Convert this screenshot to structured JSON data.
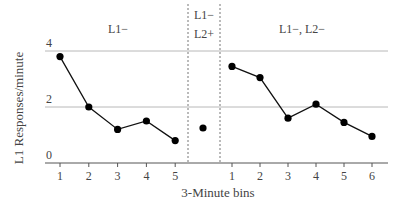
{
  "chart_data": {
    "type": "line",
    "title": "",
    "xlabel": "3-Minute bins",
    "ylabel": "L1 Responses/minute",
    "ylim": [
      0,
      4
    ],
    "yticks": [
      0,
      2,
      4
    ],
    "grid": true,
    "phases": [
      {
        "label": "L1−",
        "label_lines": [
          "L1−"
        ],
        "x": [
          1,
          2,
          3,
          4,
          5
        ],
        "values": [
          3.8,
          2.0,
          1.2,
          1.5,
          0.8
        ]
      },
      {
        "label": "L1− L2+",
        "label_lines": [
          "L1−",
          "L2+"
        ],
        "x": [
          1
        ],
        "values": [
          1.25
        ],
        "tick_labels_shown": false
      },
      {
        "label": "L1−, L2−",
        "label_lines": [
          "L1−, L2−"
        ],
        "x": [
          1,
          2,
          3,
          4,
          5,
          6
        ],
        "values": [
          3.45,
          3.05,
          1.6,
          2.1,
          1.45,
          0.95
        ]
      }
    ]
  }
}
